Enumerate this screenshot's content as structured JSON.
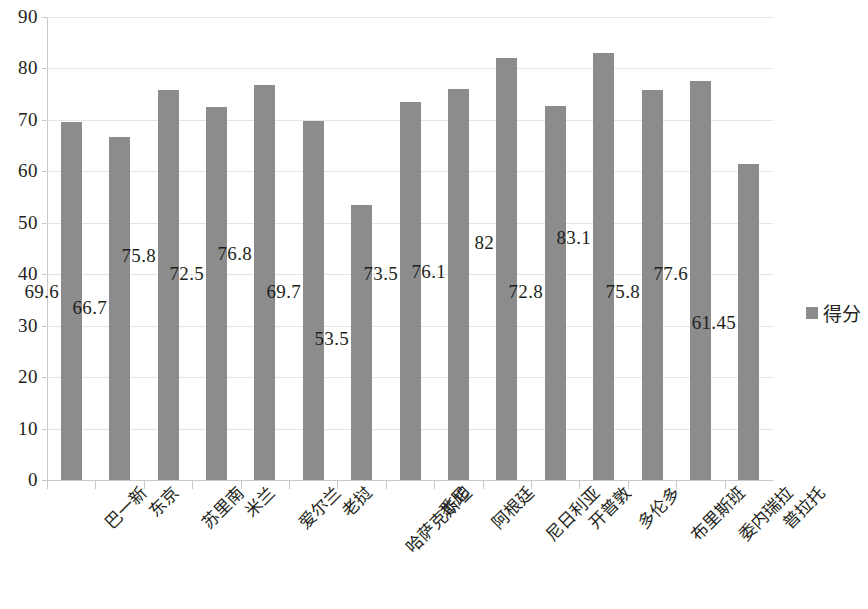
{
  "chart_data": {
    "type": "bar",
    "title": "",
    "xlabel": "",
    "ylabel": "",
    "ylim": [
      0,
      90
    ],
    "y_ticks": [
      0,
      10,
      20,
      30,
      40,
      50,
      60,
      70,
      80,
      90
    ],
    "grid": true,
    "legend_position": "right",
    "series": [
      {
        "name": "得分",
        "color": "#8C8C8C",
        "values": [
          69.6,
          66.7,
          75.8,
          72.5,
          76.8,
          69.7,
          53.5,
          73.5,
          76.1,
          82,
          72.8,
          83.1,
          75.8,
          77.6,
          61.45
        ]
      }
    ],
    "categories": [
      "巴一新",
      "东京",
      "苏里南",
      "米兰",
      "爱尔兰",
      "老挝",
      "哈萨克斯坦",
      "悉尼",
      "阿根廷",
      "尼日利亚",
      "开普敦",
      "多伦多",
      "布里斯班",
      "委内瑞拉",
      "普拉托"
    ],
    "data_labels": [
      "69.6",
      "66.7",
      "75.8",
      "72.5",
      "76.8",
      "69.7",
      "53.5",
      "73.5",
      "76.1",
      "82",
      "72.8",
      "83.1",
      "75.8",
      "77.6",
      "61.45"
    ],
    "data_label_y_values": [
      36.5,
      33.5,
      43.5,
      40.0,
      44.0,
      36.5,
      27.5,
      40.0,
      40.5,
      46.0,
      36.5,
      47.0,
      36.5,
      40.0,
      30.5
    ]
  },
  "legend": {
    "label": "得分",
    "swatch_color": "#8C8C8C"
  },
  "axis": {
    "y_tick_labels": [
      "90",
      "80",
      "70",
      "60",
      "50",
      "40",
      "30",
      "20",
      "10",
      "0"
    ]
  }
}
